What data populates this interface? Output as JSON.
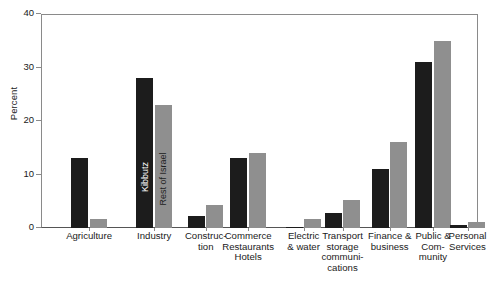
{
  "chart_data": {
    "type": "bar",
    "title": "",
    "subtitle": "",
    "xlabel": "",
    "ylabel": "Percent",
    "ylim": [
      0,
      40
    ],
    "yticks": [
      0,
      10,
      20,
      30,
      40
    ],
    "ytick_labels": [
      "0",
      "10",
      "20",
      "30",
      "40"
    ],
    "grid": false,
    "legend_position": "in-plot-rotated-on-industry-bars",
    "categories": [
      "Agriculture",
      "Industry",
      "Construc-\ntion",
      "Commerce\nRestaurants\nHotels",
      "Electric\n& water",
      "Transport\nstorage\ncommuni-\ncations",
      "Finance &\nbusiness",
      "Public &\nCom-\nmunity",
      "Personal\nServices"
    ],
    "series": [
      {
        "name": "Kibbutz",
        "color": "#1c1c1c",
        "values": [
          13.0,
          28.0,
          2.3,
          13.0,
          0.2,
          2.8,
          11.0,
          31.0,
          0.6
        ]
      },
      {
        "name": "Rest of Israel",
        "color": "#8f8f8f",
        "values": [
          1.7,
          23.0,
          4.3,
          14.0,
          1.6,
          5.2,
          16.0,
          35.0,
          1.2
        ]
      }
    ],
    "annotations": [
      {
        "text": "Kibbutz",
        "on_series": "Kibbutz",
        "on_category": "Industry",
        "orientation": "vertical"
      },
      {
        "text": "Rest of Israel",
        "on_series": "Rest of Israel",
        "on_category": "Industry",
        "orientation": "vertical"
      }
    ]
  }
}
